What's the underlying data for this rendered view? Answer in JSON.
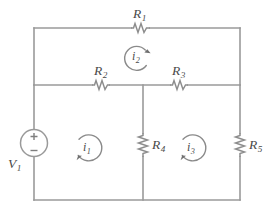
{
  "figure": {
    "type": "circuit-schematic",
    "width": 271,
    "height": 217,
    "background_color": "#ffffff",
    "line_color": "#9a9a9a",
    "text_color": "#4a4a4a"
  },
  "components": {
    "r1": {
      "base": "R",
      "sub": "1",
      "kind": "resistor",
      "orientation": "horizontal",
      "x": 140,
      "y": 28
    },
    "r2": {
      "base": "R",
      "sub": "2",
      "kind": "resistor",
      "orientation": "horizontal",
      "x": 101,
      "y": 85
    },
    "r3": {
      "base": "R",
      "sub": "3",
      "kind": "resistor",
      "orientation": "horizontal",
      "x": 179,
      "y": 85
    },
    "r4": {
      "base": "R",
      "sub": "4",
      "kind": "resistor",
      "orientation": "vertical",
      "x": 143,
      "y": 145
    },
    "r5": {
      "base": "R",
      "sub": "5",
      "kind": "resistor",
      "orientation": "vertical",
      "x": 240,
      "y": 145
    },
    "v1": {
      "base": "V",
      "sub": "1",
      "kind": "voltage-source",
      "orientation": "vertical",
      "x": 34,
      "y": 143,
      "plus": "+",
      "minus": "−"
    }
  },
  "mesh_currents": {
    "i1": {
      "base": "i",
      "sub": "1",
      "direction": "counterclockwise",
      "cx": 88,
      "cy": 148,
      "r": 13
    },
    "i2": {
      "base": "i",
      "sub": "2",
      "direction": "clockwise",
      "cx": 137,
      "cy": 57,
      "r": 12
    },
    "i3": {
      "base": "i",
      "sub": "3",
      "direction": "counterclockwise",
      "cx": 192,
      "cy": 148,
      "r": 13
    }
  },
  "nodes": {
    "top_left": [
      34,
      28
    ],
    "top_right": [
      240,
      28
    ],
    "mid_left": [
      34,
      85
    ],
    "mid_center": [
      143,
      85
    ],
    "mid_right": [
      240,
      85
    ],
    "bottom_left": [
      34,
      200
    ],
    "bottom_center": [
      143,
      200
    ],
    "bottom_right": [
      240,
      200
    ]
  }
}
